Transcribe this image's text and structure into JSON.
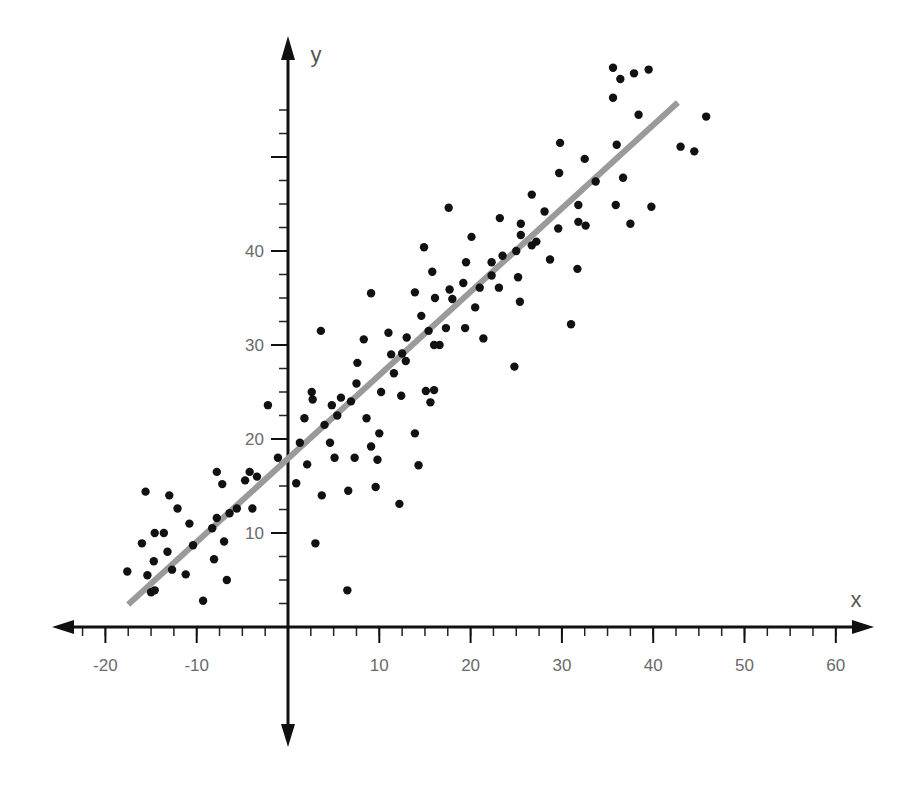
{
  "chart_data": {
    "type": "scatter",
    "title": "",
    "xlabel": "x",
    "ylabel": "y",
    "xlim": [
      -25,
      63
    ],
    "ylim": [
      -12,
      62
    ],
    "x_ticks_major": [
      -20,
      -10,
      10,
      20,
      30,
      40,
      50,
      60
    ],
    "x_tick_labels": [
      "-20",
      "-10",
      "10",
      "20",
      "30",
      "40",
      "50",
      "60"
    ],
    "x_minor_step": 2.5,
    "y_ticks_major": [
      10,
      20,
      30,
      40,
      50
    ],
    "y_tick_labels": [
      "10",
      "20",
      "30",
      "40",
      ""
    ],
    "y_minor_step": 2.5,
    "grid": false,
    "legend": null,
    "regression_line": {
      "x1": -17.5,
      "y1": 2.4,
      "x2": 42.7,
      "y2": 55.8,
      "color": "#9a9a9a"
    },
    "point_color": "#111111",
    "axis_color": "#111111",
    "series": [
      {
        "name": "observations",
        "points": [
          [
            -17.6,
            5.9
          ],
          [
            -16.0,
            8.9
          ],
          [
            -15.6,
            14.4
          ],
          [
            -15.4,
            5.5
          ],
          [
            -15.0,
            3.7
          ],
          [
            -14.6,
            3.9
          ],
          [
            -14.6,
            10.0
          ],
          [
            -14.7,
            7.0
          ],
          [
            -13.6,
            10.0
          ],
          [
            -13.0,
            14.0
          ],
          [
            -12.7,
            6.1
          ],
          [
            -13.2,
            8.0
          ],
          [
            -12.1,
            12.6
          ],
          [
            -11.2,
            5.6
          ],
          [
            -10.8,
            11.0
          ],
          [
            -10.4,
            8.7
          ],
          [
            -9.3,
            2.8
          ],
          [
            -8.3,
            10.5
          ],
          [
            -8.1,
            7.2
          ],
          [
            -7.8,
            11.6
          ],
          [
            -7.8,
            16.5
          ],
          [
            -7.2,
            15.2
          ],
          [
            -7.0,
            9.1
          ],
          [
            -6.7,
            5.0
          ],
          [
            -6.4,
            12.1
          ],
          [
            -5.6,
            12.6
          ],
          [
            -4.7,
            15.6
          ],
          [
            -4.2,
            16.5
          ],
          [
            -3.9,
            12.6
          ],
          [
            -3.4,
            16.0
          ],
          [
            -2.2,
            23.6
          ],
          [
            -1.1,
            18.0
          ],
          [
            0.9,
            15.3
          ],
          [
            1.3,
            19.6
          ],
          [
            1.8,
            22.2
          ],
          [
            2.1,
            17.3
          ],
          [
            2.6,
            25.0
          ],
          [
            2.7,
            24.2
          ],
          [
            3.0,
            8.9
          ],
          [
            3.6,
            31.5
          ],
          [
            3.7,
            14.0
          ],
          [
            4.0,
            21.5
          ],
          [
            4.6,
            19.6
          ],
          [
            4.8,
            23.6
          ],
          [
            5.1,
            18.0
          ],
          [
            5.4,
            22.5
          ],
          [
            5.8,
            24.4
          ],
          [
            6.6,
            14.5
          ],
          [
            6.5,
            3.9
          ],
          [
            6.9,
            24.0
          ],
          [
            7.3,
            18.0
          ],
          [
            7.5,
            25.9
          ],
          [
            7.6,
            28.1
          ],
          [
            8.3,
            30.6
          ],
          [
            8.6,
            22.2
          ],
          [
            9.1,
            35.5
          ],
          [
            9.1,
            19.2
          ],
          [
            9.6,
            14.9
          ],
          [
            9.8,
            17.8
          ],
          [
            10.0,
            20.6
          ],
          [
            10.2,
            25.0
          ],
          [
            11.0,
            31.3
          ],
          [
            11.3,
            29.0
          ],
          [
            11.6,
            27.0
          ],
          [
            12.2,
            13.1
          ],
          [
            12.4,
            24.6
          ],
          [
            12.5,
            29.1
          ],
          [
            12.9,
            28.3
          ],
          [
            13.0,
            30.8
          ],
          [
            13.9,
            35.6
          ],
          [
            13.9,
            20.6
          ],
          [
            14.3,
            17.2
          ],
          [
            14.6,
            33.1
          ],
          [
            14.9,
            40.4
          ],
          [
            15.1,
            25.1
          ],
          [
            15.4,
            31.5
          ],
          [
            15.6,
            23.9
          ],
          [
            15.8,
            37.8
          ],
          [
            16.0,
            30.0
          ],
          [
            16.1,
            35.0
          ],
          [
            16.0,
            25.2
          ],
          [
            16.6,
            30.0
          ],
          [
            17.3,
            31.8
          ],
          [
            17.6,
            44.6
          ],
          [
            17.7,
            35.9
          ],
          [
            18.0,
            34.9
          ],
          [
            19.2,
            36.6
          ],
          [
            19.4,
            31.8
          ],
          [
            19.5,
            38.8
          ],
          [
            20.1,
            41.5
          ],
          [
            20.5,
            34.0
          ],
          [
            21.0,
            36.1
          ],
          [
            21.4,
            30.7
          ],
          [
            22.3,
            37.4
          ],
          [
            22.3,
            38.8
          ],
          [
            23.1,
            36.1
          ],
          [
            23.2,
            43.5
          ],
          [
            23.5,
            39.5
          ],
          [
            24.8,
            27.7
          ],
          [
            25.0,
            40.0
          ],
          [
            25.2,
            37.2
          ],
          [
            25.4,
            34.6
          ],
          [
            25.5,
            42.9
          ],
          [
            25.5,
            41.7
          ],
          [
            26.7,
            46.0
          ],
          [
            26.7,
            40.6
          ],
          [
            27.2,
            41.0
          ],
          [
            28.1,
            44.2
          ],
          [
            28.7,
            39.1
          ],
          [
            29.6,
            42.4
          ],
          [
            29.7,
            48.3
          ],
          [
            29.8,
            51.5
          ],
          [
            31.0,
            32.2
          ],
          [
            31.7,
            38.1
          ],
          [
            31.8,
            43.1
          ],
          [
            31.8,
            44.9
          ],
          [
            32.5,
            49.8
          ],
          [
            32.6,
            42.7
          ],
          [
            33.7,
            47.4
          ],
          [
            35.6,
            56.3
          ],
          [
            35.9,
            44.9
          ],
          [
            36.0,
            51.3
          ],
          [
            36.4,
            58.3
          ],
          [
            36.7,
            47.8
          ],
          [
            37.5,
            42.9
          ],
          [
            37.9,
            58.9
          ],
          [
            38.4,
            54.5
          ],
          [
            39.5,
            59.3
          ],
          [
            39.8,
            44.7
          ],
          [
            43.0,
            51.1
          ],
          [
            44.5,
            50.6
          ],
          [
            35.6,
            59.5
          ],
          [
            45.8,
            54.3
          ]
        ]
      }
    ]
  }
}
